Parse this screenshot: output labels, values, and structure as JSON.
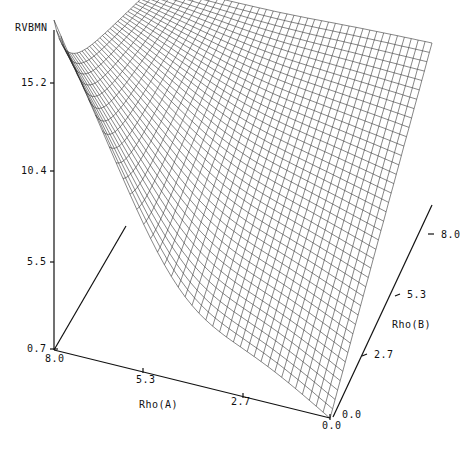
{
  "chart_data": {
    "type": "surface",
    "title": "",
    "zlabel": "RVBMN",
    "xlabel": "Rho(A)",
    "ylabel": "Rho(B)",
    "z_ticks": [
      "15.2",
      "10.4",
      "5.5",
      "0.7"
    ],
    "x_ticks": [
      "8.0",
      "5.3",
      "2.7",
      "0.0"
    ],
    "y_ticks": [
      "0.0",
      "2.7",
      "5.3",
      "8.0"
    ],
    "zlim": [
      0.7,
      15.2
    ],
    "xlim": [
      0.0,
      8.0
    ],
    "ylim": [
      0.0,
      8.0
    ],
    "grid_resolution": 40,
    "corner_values": {
      "A8_B0": 15.2,
      "A8_B8": 9.0,
      "A0_B0": 0.7,
      "A0_B8": 9.5
    }
  },
  "labels": {
    "z_axis_title": "RVBMN",
    "x_axis_title": "Rho(A)",
    "y_axis_title": "Rho(B)",
    "z_tick_0": "15.2",
    "z_tick_1": "10.4",
    "z_tick_2": "5.5",
    "z_tick_3": "0.7",
    "x_tick_0": "8.0",
    "x_tick_1": "5.3",
    "x_tick_2": "2.7",
    "x_tick_3": "0.0",
    "y_tick_0": "0.0",
    "y_tick_1": "2.7",
    "y_tick_2": "5.3",
    "y_tick_3": "8.0"
  }
}
